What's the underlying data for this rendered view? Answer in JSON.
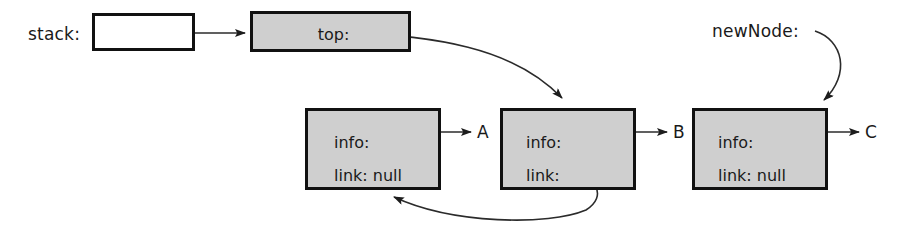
{
  "diagram": {
    "colors": {
      "node_fill": "#cfcfcf",
      "stack_box_fill": "#ffffff",
      "stroke": "#111111",
      "line": "#2b2b2b",
      "text": "#1a1a1a",
      "background": "#ffffff"
    },
    "labels": {
      "stack": "stack:",
      "newNode": "newNode:",
      "top": "top:"
    },
    "nodes": [
      {
        "id": "node-a",
        "info_label": "info:",
        "link_label": "link: null",
        "data_letter": "A"
      },
      {
        "id": "node-b",
        "info_label": "info:",
        "link_label": "link:",
        "data_letter": "B"
      },
      {
        "id": "node-c",
        "info_label": "info:",
        "link_label": "link: null",
        "data_letter": "C"
      }
    ],
    "arrows": [
      {
        "name": "stack-to-top",
        "from": "stack box",
        "to": "top box"
      },
      {
        "name": "top-to-node-b",
        "from": "top:",
        "to": "node B"
      },
      {
        "name": "node-a-info-to-a",
        "from": "node A info:",
        "to": "A"
      },
      {
        "name": "node-b-info-to-b",
        "from": "node B info:",
        "to": "B"
      },
      {
        "name": "node-c-info-to-c",
        "from": "node C info:",
        "to": "C"
      },
      {
        "name": "node-b-link-to-node-a",
        "from": "node B link:",
        "to": "node A"
      },
      {
        "name": "newnode-to-node-c",
        "from": "newNode:",
        "to": "node C"
      }
    ]
  }
}
